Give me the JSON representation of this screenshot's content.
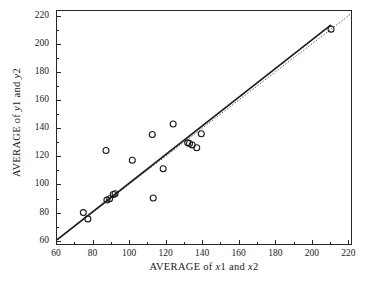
{
  "chart": {
    "type": "scatter",
    "title": "",
    "background_color": "#ffffff",
    "frame_color": "#262626"
  },
  "axes": {
    "x": {
      "label_prefix": "AVERAGE of ",
      "label_var1": "x",
      "label_sub1": "1",
      "label_mid": " and ",
      "label_var2": "x",
      "label_sub2": "2",
      "label_full": "AVERAGE of x1 and x2",
      "min": 60,
      "max": 222,
      "ticks": [
        60,
        80,
        100,
        120,
        140,
        160,
        180,
        200,
        220
      ],
      "tick_labels": [
        "60",
        "80",
        "100",
        "120",
        "140",
        "160",
        "180",
        "200",
        "220"
      ],
      "minor_ticks": [
        70,
        90,
        110,
        130,
        150,
        170,
        190,
        210
      ]
    },
    "y": {
      "label_prefix": "AVERAGE of ",
      "label_var1": "y",
      "label_sub1": "1",
      "label_mid": " and ",
      "label_var2": "y",
      "label_sub2": "2",
      "label_full": "AVERAGE of y1 and y2",
      "min": 57,
      "max": 224,
      "ticks": [
        60,
        80,
        100,
        120,
        140,
        160,
        180,
        200,
        220
      ],
      "tick_labels": [
        "60",
        "80",
        "100",
        "120",
        "140",
        "160",
        "180",
        "200",
        "220"
      ],
      "minor_ticks": [
        70,
        90,
        110,
        130,
        150,
        170,
        190,
        210
      ]
    },
    "grid": false
  },
  "chart_data": {
    "type": "scatter",
    "title": "",
    "xlabel": "AVERAGE of x1 and x2",
    "ylabel": "AVERAGE of y1 and y2",
    "xlim": [
      60,
      222
    ],
    "ylim": [
      57,
      224
    ],
    "xticks": [
      60,
      80,
      100,
      120,
      140,
      160,
      180,
      200,
      220
    ],
    "yticks": [
      60,
      80,
      100,
      120,
      140,
      160,
      180,
      200,
      220
    ],
    "grid": false,
    "legend": "none",
    "marker": "open-circle",
    "marker_color": "#1a1a1a",
    "points": [
      {
        "x": 74.5,
        "y": 79.5
      },
      {
        "x": 77.0,
        "y": 75.0
      },
      {
        "x": 87.0,
        "y": 124.0
      },
      {
        "x": 87.5,
        "y": 88.5
      },
      {
        "x": 89.0,
        "y": 89.5
      },
      {
        "x": 91.0,
        "y": 92.5
      },
      {
        "x": 92.0,
        "y": 93.0
      },
      {
        "x": 101.5,
        "y": 117.0
      },
      {
        "x": 112.5,
        "y": 135.5
      },
      {
        "x": 113.0,
        "y": 90.0
      },
      {
        "x": 118.5,
        "y": 111.0
      },
      {
        "x": 124.0,
        "y": 143.0
      },
      {
        "x": 132.0,
        "y": 129.5
      },
      {
        "x": 133.0,
        "y": 129.0
      },
      {
        "x": 134.5,
        "y": 128.0
      },
      {
        "x": 137.0,
        "y": 126.0
      },
      {
        "x": 139.5,
        "y": 136.0
      },
      {
        "x": 211.0,
        "y": 211.0
      }
    ],
    "lines": [
      {
        "name": "identity-line",
        "style": "dotted",
        "color": "#555555",
        "from": {
          "x": 60,
          "y": 60
        },
        "to": {
          "x": 222,
          "y": 222
        }
      },
      {
        "name": "regression-line",
        "style": "solid",
        "color": "#1a1a1a",
        "from": {
          "x": 60,
          "y": 60
        },
        "to": {
          "x": 211,
          "y": 214
        }
      }
    ]
  }
}
